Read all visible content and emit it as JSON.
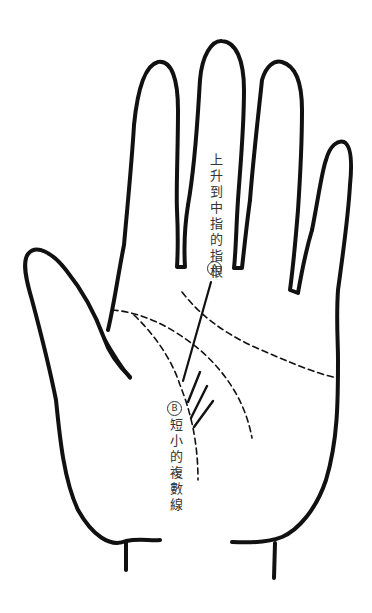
{
  "diagram": {
    "annotations": [
      {
        "id": "A",
        "badge": "A",
        "text": "上升到中指的指根",
        "target": "line rising toward base of middle finger"
      },
      {
        "id": "B",
        "badge": "B",
        "text": "短小的複數線",
        "target": "several short parallel lines"
      }
    ],
    "colors": {
      "outline": "#111111",
      "text": "#333333",
      "background": "#ffffff"
    }
  }
}
